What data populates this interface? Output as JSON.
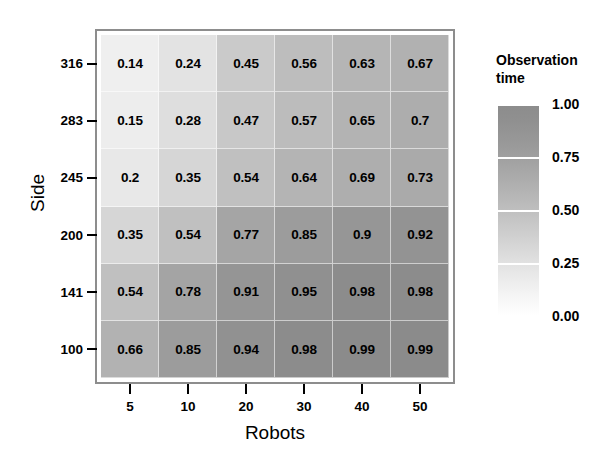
{
  "chart_data": {
    "type": "heatmap",
    "title": "",
    "xlabel": "Robots",
    "ylabel": "Side",
    "x_categories": [
      "5",
      "10",
      "20",
      "30",
      "40",
      "50"
    ],
    "y_categories": [
      "316",
      "283",
      "245",
      "200",
      "141",
      "100"
    ],
    "legend_title_line1": "Observation",
    "legend_title_line2": "time",
    "legend_ticks": [
      "1.00",
      "0.75",
      "0.50",
      "0.25",
      "0.00"
    ],
    "legend_tick_values": [
      1.0,
      0.75,
      0.5,
      0.25,
      0.0
    ],
    "colorbar_range": [
      0.0,
      1.0
    ],
    "colormap": "grayscale-light-to-dark",
    "grid": false,
    "legend_position": "right",
    "rows": [
      {
        "y": "316",
        "values": [
          0.14,
          0.24,
          0.45,
          0.56,
          0.63,
          0.67
        ],
        "labels": [
          "0.14",
          "0.24",
          "0.45",
          "0.56",
          "0.63",
          "0.67"
        ]
      },
      {
        "y": "283",
        "values": [
          0.15,
          0.28,
          0.47,
          0.57,
          0.65,
          0.7
        ],
        "labels": [
          "0.15",
          "0.28",
          "0.47",
          "0.57",
          "0.65",
          "0.7"
        ]
      },
      {
        "y": "245",
        "values": [
          0.2,
          0.35,
          0.54,
          0.64,
          0.69,
          0.73
        ],
        "labels": [
          "0.2",
          "0.35",
          "0.54",
          "0.64",
          "0.69",
          "0.73"
        ]
      },
      {
        "y": "200",
        "values": [
          0.35,
          0.54,
          0.77,
          0.85,
          0.9,
          0.92
        ],
        "labels": [
          "0.35",
          "0.54",
          "0.77",
          "0.85",
          "0.9",
          "0.92"
        ]
      },
      {
        "y": "141",
        "values": [
          0.54,
          0.78,
          0.91,
          0.95,
          0.98,
          0.98
        ],
        "labels": [
          "0.54",
          "0.78",
          "0.91",
          "0.95",
          "0.98",
          "0.98"
        ]
      },
      {
        "y": "100",
        "values": [
          0.66,
          0.85,
          0.94,
          0.98,
          0.99,
          0.99
        ],
        "labels": [
          "0.66",
          "0.85",
          "0.94",
          "0.98",
          "0.99",
          "0.99"
        ]
      }
    ]
  },
  "colors": {
    "panel_border": "#8d8d8d",
    "text": "#000000",
    "background": "#ffffff",
    "scale_min": "#ffffff",
    "scale_max": "#8c8c8c"
  }
}
